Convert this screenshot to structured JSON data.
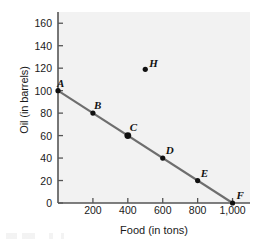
{
  "chart_data": {
    "type": "line",
    "title": "",
    "xlabel": "Food (in tons)",
    "ylabel": "Oil (in barrels)",
    "xlim": [
      0,
      1100
    ],
    "ylim": [
      0,
      170
    ],
    "grid": false,
    "legend": "none",
    "x_ticks": [
      {
        "value": 200,
        "label": "200"
      },
      {
        "value": 400,
        "label": "400"
      },
      {
        "value": 600,
        "label": "600"
      },
      {
        "value": 800,
        "label": "800"
      },
      {
        "value": 1000,
        "label": "1,000"
      }
    ],
    "y_ticks": [
      {
        "value": 0,
        "label": "0"
      },
      {
        "value": 20,
        "label": "20"
      },
      {
        "value": 40,
        "label": "40"
      },
      {
        "value": 60,
        "label": "60"
      },
      {
        "value": 80,
        "label": "80"
      },
      {
        "value": 100,
        "label": "100"
      },
      {
        "value": 120,
        "label": "120"
      },
      {
        "value": 140,
        "label": "140"
      },
      {
        "value": 160,
        "label": "160"
      }
    ],
    "series": [
      {
        "name": "production possibilities frontier",
        "type": "line",
        "color": "#6e6e6e",
        "x": [
          0,
          1000
        ],
        "y": [
          100,
          0
        ]
      }
    ],
    "points": [
      {
        "label": "A",
        "x": 0,
        "y": 100,
        "on_line": true,
        "marker_size": "medium",
        "label_dx": -1,
        "label_dy": -13
      },
      {
        "label": "B",
        "x": 200,
        "y": 80,
        "on_line": true,
        "marker_size": "medium",
        "label_dx": 1,
        "label_dy": -13
      },
      {
        "label": "C",
        "x": 400,
        "y": 60,
        "on_line": true,
        "marker_size": "large",
        "label_dx": 2,
        "label_dy": -14
      },
      {
        "label": "D",
        "x": 600,
        "y": 40,
        "on_line": true,
        "marker_size": "medium",
        "label_dx": 3,
        "label_dy": -13
      },
      {
        "label": "E",
        "x": 800,
        "y": 20,
        "on_line": true,
        "marker_size": "medium",
        "label_dx": 3,
        "label_dy": -13
      },
      {
        "label": "F",
        "x": 1000,
        "y": 0,
        "on_line": true,
        "marker_size": "medium",
        "label_dx": 4,
        "label_dy": -13
      },
      {
        "label": "H",
        "x": 500,
        "y": 119,
        "on_line": false,
        "marker_size": "medium",
        "label_dx": 4,
        "label_dy": -11
      }
    ],
    "colors": {
      "plot_background": "#f2f2f2",
      "axis": "#555555",
      "line": "#6e6e6e",
      "marker": "#111111",
      "text": "#1a1a1a"
    }
  }
}
